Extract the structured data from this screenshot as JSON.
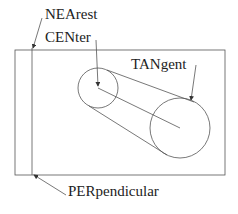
{
  "diagram": {
    "labels": {
      "nearest": "NEArest",
      "center": "CENter",
      "tangent": "TANgent",
      "perpendicular": "PERpendicular"
    },
    "colors": {
      "line": "#555555",
      "text": "#222222",
      "background": "#ffffff"
    }
  }
}
